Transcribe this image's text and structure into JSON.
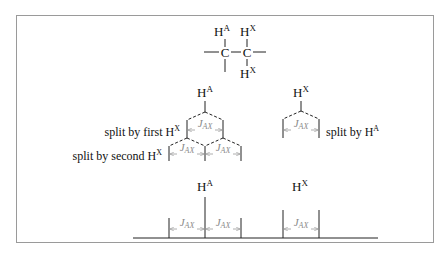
{
  "molecule": {
    "atoms": {
      "h_top_left": {
        "base": "H",
        "sup": "A"
      },
      "h_top_right": {
        "base": "H",
        "sup": "X"
      },
      "carbon_left": "C",
      "carbon_right": "C",
      "h_bottom_right": {
        "base": "H",
        "sup": "X"
      }
    }
  },
  "tree_a": {
    "nucleus": {
      "base": "H",
      "sup": "A"
    },
    "split1_label": {
      "text": "split by first H",
      "sup": "X"
    },
    "split2_label": {
      "text": "split by second H",
      "sup": "X"
    },
    "coupling_label": {
      "base": "J",
      "sub": "AX"
    }
  },
  "tree_x": {
    "nucleus": {
      "base": "H",
      "sup": "X"
    },
    "split_label": {
      "text": "split by H",
      "sup": "A"
    },
    "coupling_label": {
      "base": "J",
      "sub": "AX"
    }
  },
  "spectrum": {
    "peak_a": {
      "base": "H",
      "sup": "A",
      "multiplicity": "triplet"
    },
    "peak_x": {
      "base": "H",
      "sup": "X",
      "multiplicity": "doublet"
    },
    "coupling_label": {
      "base": "J",
      "sub": "AX"
    }
  },
  "colors": {
    "line": "#222222",
    "arrow": "#9a9a9a",
    "frame": "#9a9a9a"
  }
}
